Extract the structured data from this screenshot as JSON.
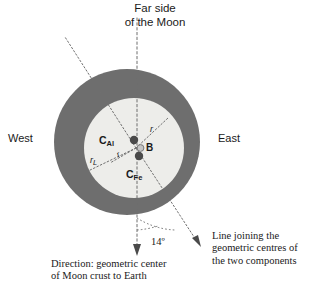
{
  "figure": {
    "type": "diagram",
    "background_color": "#ffffff"
  },
  "labels": {
    "top_title": "Far side\nof the Moon",
    "west": "West",
    "east": "East",
    "c_al_main": "C",
    "c_al_sub": "Al",
    "c_fe_main": "C",
    "c_fe_sub": "Fe",
    "b_point": "B",
    "radius_r_upper": "r",
    "radius_r_lower": "r",
    "radius_r_lower_sub": "L",
    "radius_r_inner": "r",
    "angle": "14º",
    "caption_left": "Direction: geometric center\nof Moon crust to Earth",
    "caption_right": "Line joining the\ngeometric centres of\nthe two components"
  },
  "geometry": {
    "outer_circle": {
      "cx": 127,
      "cy": 142,
      "r": 73,
      "fill": "#6e6e6e"
    },
    "inner_circle": {
      "cx": 134,
      "cy": 148,
      "r": 50,
      "fill": "#ededea"
    },
    "markers": [
      {
        "name": "C_Al",
        "cx": 134,
        "cy": 140,
        "r": 4.2,
        "fill": "#4a4a4a"
      },
      {
        "name": "B",
        "cx": 140,
        "cy": 148,
        "r": 3.6,
        "fill": "#bdbdbd",
        "stroke": "#6e6e6e"
      },
      {
        "name": "C_Fe",
        "cx": 139,
        "cy": 156,
        "r": 4.2,
        "fill": "#4a4a4a"
      }
    ],
    "vertical_axis": {
      "x": 137,
      "y1": 18,
      "y2": 252
    },
    "tilted_axis_angle_deg": 14
  },
  "colors": {
    "crust_dark": "#6e6e6e",
    "interior_light": "#ededea",
    "marker_dark": "#4a4a4a",
    "marker_light": "#bdbdbd",
    "dotted_line": "#707070",
    "text": "#1a1a1a"
  }
}
